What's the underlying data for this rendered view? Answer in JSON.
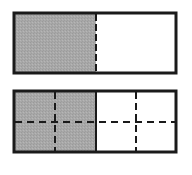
{
  "diagram": {
    "colors": {
      "shaded": "#a8a8a8",
      "border": "#1a1a1a",
      "background": "#ffffff"
    },
    "bars": [
      {
        "id": "bar-halves",
        "x": 13,
        "y": 12,
        "width": 164,
        "height": 62,
        "columns": 2,
        "rows": 1,
        "shaded_columns": 1,
        "fraction_shaded": "1/2"
      },
      {
        "id": "bar-quarters-split",
        "x": 13,
        "y": 91,
        "width": 164,
        "height": 61,
        "columns": 4,
        "rows": 2,
        "shaded_columns": 2,
        "fraction_shaded": "4/8"
      }
    ]
  }
}
